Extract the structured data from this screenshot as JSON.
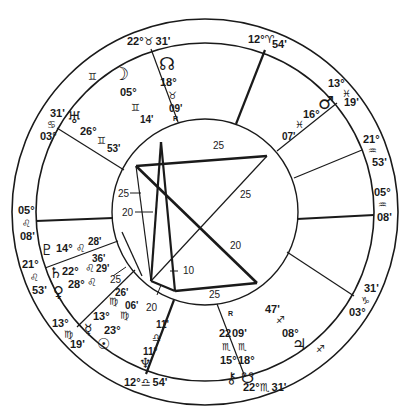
{
  "chart_title": "Natal chart wheel",
  "colors": {
    "ink": "#1a1a1a",
    "background": "#ffffff"
  },
  "cusps": [
    {
      "id": "mc",
      "deg": "12°",
      "sign": "♈",
      "min": "54'"
    },
    {
      "id": "c11",
      "deg": "13°",
      "sign": "♓",
      "min": "19'"
    },
    {
      "id": "c12",
      "deg": "21°",
      "sign": "♒",
      "min": "53'"
    },
    {
      "id": "asc_side",
      "deg": "05°",
      "sign": "♒",
      "min": "08'"
    },
    {
      "id": "c2",
      "deg": "03°",
      "sign": "♑",
      "min": "31'"
    },
    {
      "id": "c3",
      "deg": "22°",
      "sign": "♏",
      "min": "31'"
    },
    {
      "id": "ic",
      "deg": "12°",
      "sign": "♎",
      "min": "54'"
    },
    {
      "id": "c5",
      "deg": "13°",
      "sign": "♍",
      "min": "19'"
    },
    {
      "id": "c6",
      "deg": "21°",
      "sign": "♌",
      "min": "53'"
    },
    {
      "id": "dsc_side",
      "deg": "05°",
      "sign": "♌",
      "min": "08'"
    },
    {
      "id": "c8",
      "deg": "03°",
      "sign": "♋",
      "min": "31'"
    },
    {
      "id": "c9",
      "deg": "22°",
      "sign": "♉",
      "min": "31'"
    }
  ],
  "ring_signs": {
    "gemini": "♊",
    "sagittarius": "♐"
  },
  "planets": [
    {
      "name": "North Node",
      "glyph": "☊",
      "deg": "18°",
      "sign": "♉",
      "min": "09'",
      "retro": "R"
    },
    {
      "name": "Moon",
      "glyph": "☽",
      "deg": "05°",
      "sign": "♊",
      "min": "14'"
    },
    {
      "name": "Uranus",
      "glyph": "♅",
      "deg": "26°",
      "sign": "♊",
      "min": "53'"
    },
    {
      "name": "Mars",
      "glyph": "♂",
      "deg": "16°",
      "sign": "♓",
      "min": "07'"
    },
    {
      "name": "Pluto",
      "glyph": "♇",
      "deg": "14°",
      "sign": "♌",
      "min": "28'"
    },
    {
      "name": "Saturn",
      "glyph": "♄",
      "deg": "22°",
      "sign": "♌",
      "min": "36'"
    },
    {
      "name": "Venus",
      "glyph": "♀",
      "deg": "28°",
      "sign": "♌",
      "min": "29'"
    },
    {
      "name": "Mercury",
      "glyph": "☿",
      "deg": "13°",
      "sign": "♍",
      "min": "26'"
    },
    {
      "name": "Sun",
      "glyph": "☉",
      "deg": "23°",
      "sign": "♍",
      "min": "06'"
    },
    {
      "name": "Neptune",
      "glyph": "♆",
      "deg": "11°",
      "sign": "♎",
      "min": "11'"
    },
    {
      "name": "Chiron",
      "glyph": "⚷",
      "deg": "15°",
      "sign": "♏",
      "min": "22'"
    },
    {
      "name": "South Node",
      "glyph": "☋",
      "deg": "18°",
      "sign": "♏",
      "min": "09'",
      "retro": "R"
    },
    {
      "name": "Jupiter",
      "glyph": "♃",
      "deg": "08°",
      "sign": "♐",
      "min": "47'"
    }
  ],
  "aspect_labels": [
    "25",
    "25",
    "25",
    "20",
    "20",
    "10",
    "25",
    "20",
    "25"
  ]
}
